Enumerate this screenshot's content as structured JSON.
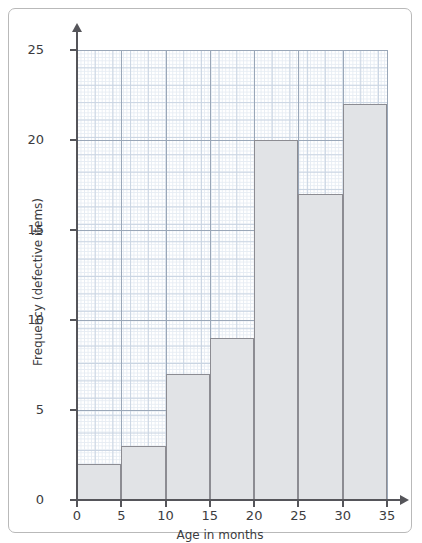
{
  "chart_data": {
    "type": "bar",
    "title": "",
    "subtitle": "",
    "xlabel": "Age in months",
    "ylabel": "Frequency (defective items)",
    "categories": [
      "0-5",
      "5-10",
      "10-15",
      "15-20",
      "20-25",
      "25-30",
      "30-35"
    ],
    "bin_edges": [
      0,
      5,
      10,
      15,
      20,
      25,
      30,
      35
    ],
    "values": [
      2,
      3,
      7,
      9,
      20,
      17,
      22
    ],
    "x": [
      0,
      5,
      10,
      15,
      20,
      25,
      30,
      35
    ],
    "xlim": [
      0,
      35
    ],
    "ylim": [
      0,
      25
    ],
    "xticks": [
      "0",
      "5",
      "10",
      "15",
      "20",
      "25",
      "30",
      "35"
    ],
    "yticks": [
      "0",
      "5",
      "10",
      "15",
      "20",
      "25"
    ],
    "xtick_values": [
      0,
      5,
      10,
      15,
      20,
      25,
      30,
      35
    ],
    "ytick_values": [
      0,
      5,
      10,
      15,
      20,
      25
    ],
    "grid": true,
    "grid_style": "graph-paper minor 0.2 unit, major 1 unit",
    "legend": false,
    "legend_position": "none",
    "annotations": [],
    "colors": {
      "bar_fill": "#e1e3e6",
      "bar_stroke": "#8c8c92",
      "axis": "#55555a",
      "grid_minor": "#e6ecf3",
      "grid_major": "#c9d4e2",
      "grid_major5": "#9aa7b8",
      "frame": "#b9b9b9",
      "text": "#3c3c40",
      "background": "#ffffff"
    }
  },
  "figure": {
    "frame_label": "chart-frame",
    "x_axis_arrow": "arrow-right-icon",
    "y_axis_arrow": "arrow-up-icon"
  }
}
